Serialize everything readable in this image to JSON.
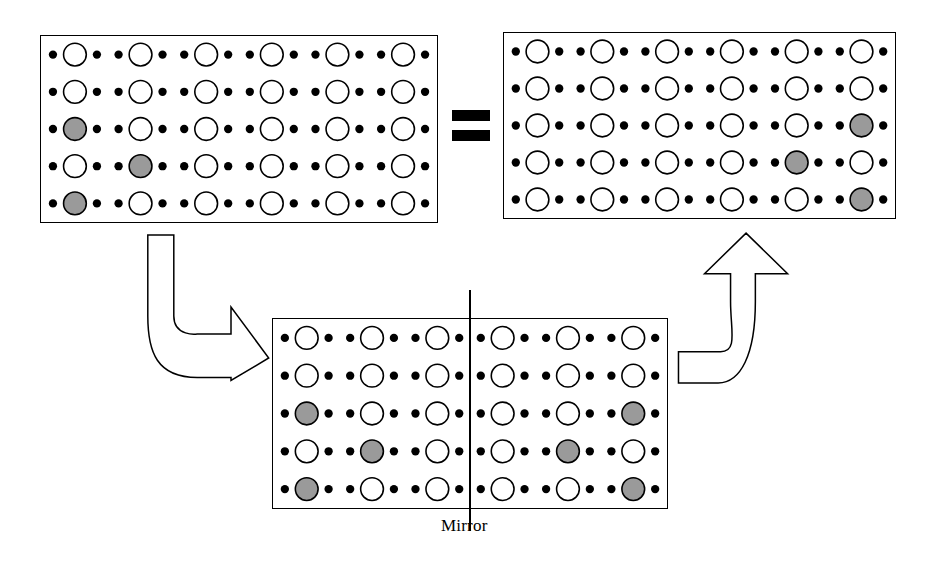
{
  "figure": {
    "background_color": "#ffffff",
    "stroke_color": "#000000",
    "dot_color": "#000000",
    "circle_fill_empty": "#ffffff",
    "circle_fill_marked": "#9a9a9a"
  },
  "labels": {
    "mirror": "Mirror",
    "equals": "="
  },
  "lattice_geometry": {
    "rows": 5,
    "unit_pattern": [
      "small-dot",
      "large-circle",
      "small-dot"
    ],
    "small_dot_radius": 4.2,
    "large_circle_radius": 11.5,
    "columns_top": 6,
    "columns_bottom": 6
  },
  "panels": [
    {
      "id": "source-panel",
      "name": "top-left-lattice-panel",
      "role": "original",
      "x": 40,
      "y": 35,
      "width": 398,
      "height": 188,
      "rows": 5,
      "columns": 6,
      "marked_cells": [
        {
          "row": 3,
          "col": 1
        },
        {
          "row": 4,
          "col": 2
        },
        {
          "row": 5,
          "col": 1
        }
      ],
      "mirror_line": null
    },
    {
      "id": "result-panel",
      "name": "top-right-lattice-panel",
      "role": "mirrored-result",
      "x": 503,
      "y": 32,
      "width": 393,
      "height": 187,
      "rows": 5,
      "columns": 6,
      "marked_cells": [
        {
          "row": 3,
          "col": 6
        },
        {
          "row": 4,
          "col": 5
        },
        {
          "row": 5,
          "col": 6
        }
      ],
      "mirror_line": null
    },
    {
      "id": "mirror-panel",
      "name": "bottom-mirror-lattice-panel",
      "role": "mirror-construction",
      "x": 272,
      "y": 318,
      "width": 396,
      "height": 191,
      "rows": 5,
      "columns": 6,
      "marked_cells": [
        {
          "row": 3,
          "col": 1
        },
        {
          "row": 4,
          "col": 2
        },
        {
          "row": 5,
          "col": 1
        },
        {
          "row": 3,
          "col": 6
        },
        {
          "row": 4,
          "col": 5
        },
        {
          "row": 5,
          "col": 6
        }
      ],
      "mirror_line": {
        "after_column": 3,
        "top_overhang": 28,
        "bottom_overhang": 22
      }
    }
  ],
  "equals_sign": {
    "name": "equals-sign",
    "x": 452,
    "y": 110,
    "bar_width": 38,
    "bar_height": 11,
    "bar_gap": 9
  },
  "arrows": [
    {
      "id": "arrow-down-right",
      "name": "arrow-down-right",
      "direction": "down-then-right",
      "x": 140,
      "y": 232,
      "width": 130,
      "height": 150
    },
    {
      "id": "arrow-right-up",
      "name": "arrow-right-up",
      "direction": "right-then-up",
      "x": 676,
      "y": 230,
      "width": 124,
      "height": 156
    }
  ],
  "mirror_caption": {
    "text": "Mirror",
    "x": 441,
    "y": 516
  }
}
